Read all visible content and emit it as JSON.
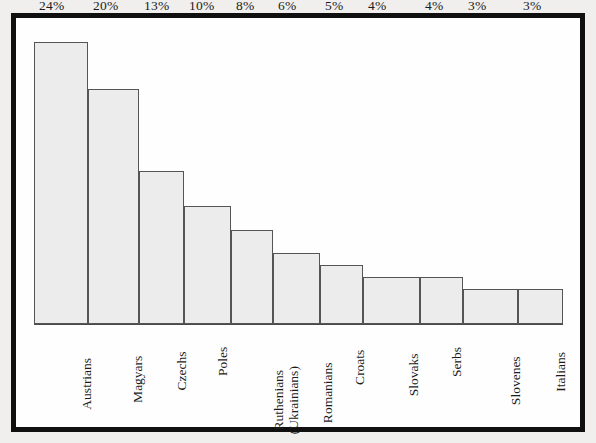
{
  "chart_data": {
    "type": "bar",
    "title": "",
    "subtitle": "",
    "xlabel": "",
    "ylabel": "",
    "grid": false,
    "legend": "none",
    "ylim": [
      0,
      26
    ],
    "value_suffix": "%",
    "categories": [
      "Austrians",
      "Magyars",
      "Czechs",
      "Poles",
      "Ruthenians (Ukrainians)",
      "Romanians",
      "Croats",
      "Slovaks",
      "Serbs",
      "Slovenes",
      "Italians"
    ],
    "category_lines": [
      [
        "Austrians"
      ],
      [
        "Magyars"
      ],
      [
        "Czechs"
      ],
      [
        "Poles"
      ],
      [
        "Ruthenians",
        "(Ukrainians)"
      ],
      [
        "Romanians"
      ],
      [
        "Croats"
      ],
      [
        "Slovaks"
      ],
      [
        "Serbs"
      ],
      [
        "Slovenes"
      ],
      [
        "Italians"
      ]
    ],
    "values": [
      24,
      20,
      13,
      10,
      8,
      6,
      5,
      4,
      4,
      3,
      3
    ],
    "value_labels": [
      "24%",
      "20%",
      "13%",
      "10%",
      "8%",
      "6%",
      "5%",
      "4%",
      "4%",
      "3%",
      "3%"
    ],
    "bar_fill_color": "#ececec",
    "bar_border_color": "#555555",
    "frame_color": "#101010",
    "plot_background": "#fefefe",
    "page_background": "#f0efed"
  }
}
